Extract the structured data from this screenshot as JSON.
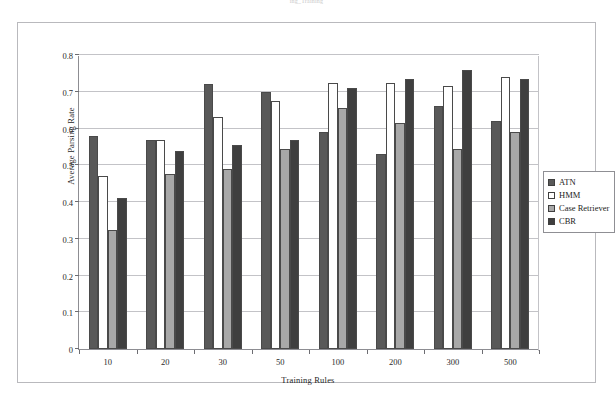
{
  "top_caption": "ing_Training",
  "chart_data": {
    "type": "bar",
    "title": "",
    "xlabel": "Training Rules",
    "ylabel": "Average Parsing Rate",
    "categories": [
      "10",
      "20",
      "30",
      "50",
      "100",
      "200",
      "300",
      "500"
    ],
    "ylim": [
      0,
      0.8
    ],
    "yticks": [
      "0",
      "0.1",
      "0.2",
      "0.3",
      "0.4",
      "0.5",
      "0.6",
      "0.7",
      "0.8"
    ],
    "ytick_values": [
      0,
      0.1,
      0.2,
      0.3,
      0.4,
      0.5,
      0.6,
      0.7,
      0.8
    ],
    "grid": true,
    "legend_position": "right",
    "series": [
      {
        "name": "ATN",
        "color": "#595959",
        "values": [
          0.58,
          0.57,
          0.72,
          0.7,
          0.59,
          0.53,
          0.66,
          0.62
        ]
      },
      {
        "name": "HMM",
        "color": "#ffffff",
        "values": [
          0.47,
          0.57,
          0.63,
          0.675,
          0.725,
          0.725,
          0.715,
          0.74
        ]
      },
      {
        "name": "Case Retriever",
        "color": "#a8a8a8",
        "values": [
          0.325,
          0.475,
          0.49,
          0.545,
          0.655,
          0.615,
          0.545,
          0.59
        ]
      },
      {
        "name": "CBR",
        "color": "#3f3f3f",
        "values": [
          0.41,
          0.54,
          0.555,
          0.57,
          0.71,
          0.735,
          0.76,
          0.735
        ]
      }
    ]
  }
}
